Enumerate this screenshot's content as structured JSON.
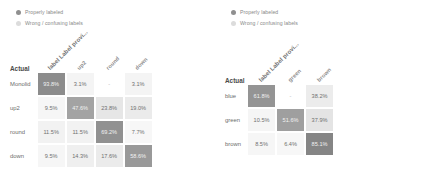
{
  "colors": {
    "properly_labeled": "#7a7a7a",
    "wrong_labels": "#d8d8d8",
    "diagonal_fill": "#8c8c8c",
    "offdiag_fill": "#ededed",
    "text": "#707070"
  },
  "legend": {
    "items": [
      {
        "label": "Properly labeled",
        "color": "#8f8f8f",
        "icon": "legend-dot-icon"
      },
      {
        "label": "Wrong / confusing labels",
        "color": "#dcdcdc",
        "icon": "legend-dot-icon"
      }
    ]
  },
  "panels": [
    {
      "id": "eyelid-shape",
      "row_header": "Actual",
      "column_header_first": "label Label provi...",
      "chart_data": {
        "type": "heatmap",
        "title": "",
        "xlabel": "",
        "ylabel": "Actual",
        "categories": [
          "Monolid",
          "up2",
          "round",
          "down"
        ],
        "columns": [
          "Monolid",
          "up2",
          "round",
          "down"
        ],
        "rows": [
          {
            "name": "Monolid",
            "values": [
              93.8,
              3.1,
              null,
              3.1
            ],
            "display": [
              "93.8%",
              "3.1%",
              "-",
              "3.1%"
            ]
          },
          {
            "name": "up2",
            "values": [
              9.5,
              47.6,
              23.8,
              19.0
            ],
            "display": [
              "9.5%",
              "47.6%",
              "23.8%",
              "19.0%"
            ]
          },
          {
            "name": "round",
            "values": [
              11.5,
              11.5,
              69.2,
              7.7
            ],
            "display": [
              "11.5%",
              "11.5%",
              "69.2%",
              "7.7%"
            ]
          },
          {
            "name": "down",
            "values": [
              9.5,
              14.3,
              17.6,
              58.6
            ],
            "display": [
              "9.5%",
              "14.3%",
              "17.6%",
              "58.6%"
            ]
          }
        ]
      }
    },
    {
      "id": "eye-color",
      "row_header": "Actual",
      "column_header_first": "label Label provi...",
      "chart_data": {
        "type": "heatmap",
        "title": "",
        "xlabel": "",
        "ylabel": "Actual",
        "categories": [
          "blue",
          "green",
          "brown"
        ],
        "columns": [
          "blue",
          "green",
          "brown"
        ],
        "rows": [
          {
            "name": "blue",
            "values": [
              61.8,
              null,
              38.2
            ],
            "display": [
              "61.8%",
              "-",
              "38.2%"
            ]
          },
          {
            "name": "green",
            "values": [
              10.5,
              51.6,
              37.9
            ],
            "display": [
              "10.5%",
              "51.6%",
              "37.9%"
            ]
          },
          {
            "name": "brown",
            "values": [
              8.5,
              6.4,
              85.1
            ],
            "display": [
              "8.5%",
              "6.4%",
              "85.1%"
            ]
          }
        ]
      }
    }
  ]
}
